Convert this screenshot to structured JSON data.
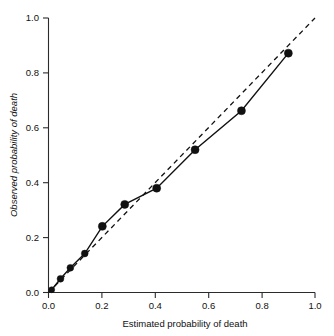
{
  "chart_data": {
    "type": "line",
    "title": "",
    "subtitle": "",
    "xlabel": "Estimated probability of death",
    "ylabel": "Observed probability of death",
    "xlim": [
      0.0,
      1.0
    ],
    "ylim": [
      0.0,
      1.0
    ],
    "xticks": [
      "0.0",
      "0.2",
      "0.4",
      "0.6",
      "0.8",
      "1.0"
    ],
    "xtick_values": [
      0.0,
      0.2,
      0.4,
      0.6,
      0.8,
      1.0
    ],
    "yticks": [
      "0.0",
      "0.2",
      "0.4",
      "0.6",
      "0.8",
      "1.0"
    ],
    "ytick_values": [
      0.0,
      0.2,
      0.4,
      0.6,
      0.8,
      1.0
    ],
    "grid": false,
    "legend": "none",
    "series": [
      {
        "name": "Observed vs estimated",
        "style": "solid-with-markers",
        "color": "#111111",
        "marker": "filled-circle",
        "x": [
          0.012,
          0.045,
          0.082,
          0.136,
          0.202,
          0.286,
          0.406,
          0.55,
          0.724,
          0.9
        ],
        "y": [
          0.01,
          0.05,
          0.09,
          0.142,
          0.241,
          0.321,
          0.38,
          0.52,
          0.662,
          0.872
        ]
      },
      {
        "name": "Perfect calibration reference",
        "style": "dashed",
        "color": "#111111",
        "marker": "none",
        "x": [
          0.0,
          1.0
        ],
        "y": [
          0.0,
          1.0
        ]
      }
    ],
    "annotations": []
  },
  "axes": {
    "x_title": "Estimated probability of death",
    "y_title": "Observed probability of death"
  }
}
